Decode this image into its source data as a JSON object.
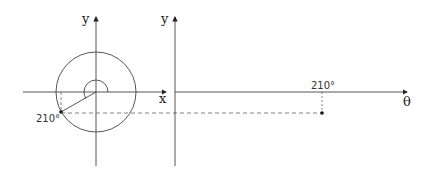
{
  "figure": {
    "left_panel": {
      "axis_x_label": "x",
      "axis_y_label": "y",
      "angle_label": "210°"
    },
    "right_panel": {
      "axis_x_label": "θ",
      "axis_y_label": "y",
      "tick_label": "210°"
    }
  },
  "colors": {
    "stroke": "#333333",
    "background": "#ffffff"
  }
}
